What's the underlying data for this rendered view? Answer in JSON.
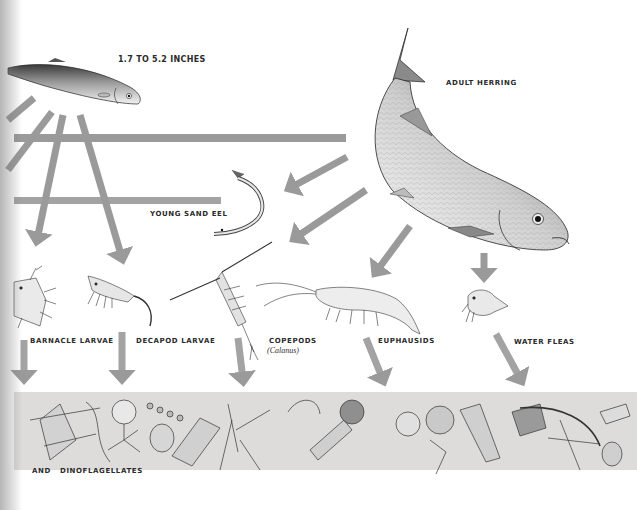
{
  "colors": {
    "arrow": "#9a9a9a",
    "band": "#dddcda",
    "ink": "#2b2b2b",
    "background": "#ffffff"
  },
  "labels": {
    "juvenile_size": "1.7 TO 5.2 INCHES",
    "adult_herring": "ADULT HERRING",
    "young_sand_eel": "YOUNG SAND EEL",
    "barnacle_larvae": "BARNACLE LARVAE",
    "decapod_larvae": "DECAPOD LARVAE",
    "copepods": "COPEPODS",
    "copepods_genus": "(Calanus)",
    "euphausids": "EUPHAUSIDS",
    "water_fleas": "WATER FLEAS",
    "plankton_band": "AND   DINOFLAGELLATES"
  },
  "organisms": [
    {
      "id": "juvenile-herring",
      "label_key": "juvenile_size"
    },
    {
      "id": "adult-herring",
      "label_key": "adult_herring"
    },
    {
      "id": "young-sand-eel",
      "label_key": "young_sand_eel"
    },
    {
      "id": "barnacle-larvae",
      "label_key": "barnacle_larvae"
    },
    {
      "id": "decapod-larvae",
      "label_key": "decapod_larvae"
    },
    {
      "id": "copepods",
      "label_key": "copepods"
    },
    {
      "id": "euphausids",
      "label_key": "euphausids"
    },
    {
      "id": "water-fleas",
      "label_key": "water_fleas"
    },
    {
      "id": "diatoms-dinoflagellates",
      "label_key": "plankton_band"
    }
  ]
}
